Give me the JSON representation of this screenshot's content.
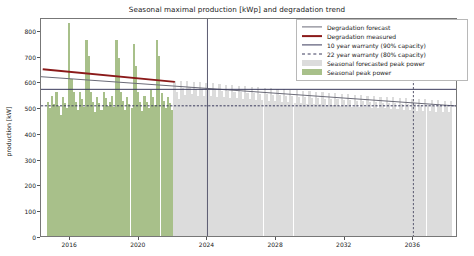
{
  "chart_data": {
    "type": "bar",
    "title": "Seasonal maximal production [kWp] and degradation trend",
    "xlabel": "",
    "ylabel": "production [kW]",
    "ylim": [
      0,
      850
    ],
    "xlim": [
      2014.3,
      2038.6
    ],
    "yticks": [
      0,
      100,
      200,
      300,
      400,
      500,
      600,
      700,
      800
    ],
    "xticks": [
      2016,
      2020,
      2024,
      2028,
      2032,
      2036
    ],
    "grid": false,
    "legend_position": "upper right",
    "colors": {
      "degradation_forecast": "#6b6b78",
      "degradation_measured": "#8b1a1a",
      "warranty_10yr": "#3a3a5c",
      "warranty_22yr": "#3a3a5c",
      "seasonal_forecast_bars": "#dcdcdc",
      "seasonal_peak_bars": "#a8c08a",
      "axis": "#777777",
      "text": "#1a1a1a"
    },
    "series": [
      {
        "name": "Degradation forecast",
        "type": "line",
        "style": "solid",
        "color": "#6b6b78",
        "points": [
          [
            2014.3,
            626
          ],
          [
            2038.6,
            512
          ]
        ]
      },
      {
        "name": "Degradation measured",
        "type": "line",
        "style": "solid",
        "color": "#8b1a1a",
        "points": [
          [
            2014.4,
            655
          ],
          [
            2022.1,
            606
          ]
        ]
      },
      {
        "name": "10 year warranty (90% capacity)",
        "type": "hline",
        "style": "solid",
        "color": "#3a3a5c",
        "value": 577
      },
      {
        "name": "22 year warranty (80% capacity)",
        "type": "hline",
        "style": "dashed",
        "color": "#3a3a5c",
        "value": 513
      },
      {
        "name": "10 year warranty end",
        "type": "vline",
        "style": "solid",
        "color": "#5a5a70",
        "value": 2024.0
      },
      {
        "name": "22 year warranty end",
        "type": "vline",
        "style": "dashed",
        "color": "#5a5a70",
        "value": 2036.0
      }
    ],
    "bar_series": [
      {
        "name": "Seasonal peak power",
        "color": "#a8c08a",
        "x": [
          2014.7,
          2014.82,
          2014.95,
          2015.08,
          2015.2,
          2015.33,
          2015.45,
          2015.58,
          2015.7,
          2015.83,
          2015.95,
          2016.08,
          2016.2,
          2016.33,
          2016.45,
          2016.58,
          2016.7,
          2016.83,
          2016.95,
          2017.08,
          2017.2,
          2017.33,
          2017.45,
          2017.58,
          2017.7,
          2017.83,
          2017.95,
          2018.08,
          2018.2,
          2018.33,
          2018.45,
          2018.58,
          2018.7,
          2018.83,
          2018.95,
          2019.08,
          2019.2,
          2019.33,
          2019.45,
          2019.58,
          2019.7,
          2019.83,
          2019.95,
          2020.08,
          2020.2,
          2020.33,
          2020.45,
          2020.58,
          2020.7,
          2020.83,
          2020.95,
          2021.08,
          2021.2,
          2021.33,
          2021.45,
          2021.58,
          2021.7,
          2021.83,
          2021.95
        ],
        "values": [
          520,
          498,
          545,
          512,
          560,
          505,
          470,
          540,
          515,
          495,
          825,
          610,
          560,
          520,
          490,
          560,
          530,
          500,
          760,
          700,
          560,
          520,
          480,
          540,
          515,
          490,
          560,
          535,
          505,
          520,
          545,
          500,
          760,
          690,
          560,
          525,
          490,
          540,
          512,
          495,
          745,
          660,
          560,
          520,
          485,
          545,
          520,
          498,
          565,
          540,
          510,
          760,
          700,
          555,
          525,
          495,
          540,
          515,
          490
        ]
      },
      {
        "name": "Seasonal forecasted peak power",
        "color": "#dcdcdc",
        "x": [
          2022.08,
          2022.2,
          2022.33,
          2022.45,
          2022.58,
          2022.7,
          2022.83,
          2022.95,
          2023.08,
          2023.2,
          2023.33,
          2023.45,
          2023.58,
          2023.7,
          2023.83,
          2023.95,
          2024.08,
          2024.2,
          2024.33,
          2024.45,
          2024.58,
          2024.7,
          2024.83,
          2024.95,
          2025.08,
          2025.2,
          2025.33,
          2025.45,
          2025.58,
          2025.7,
          2025.83,
          2025.95,
          2026.08,
          2026.2,
          2026.33,
          2026.45,
          2026.58,
          2026.7,
          2026.83,
          2026.95,
          2027.08,
          2027.2,
          2027.33,
          2027.45,
          2027.58,
          2027.7,
          2027.83,
          2027.95,
          2028.08,
          2028.2,
          2028.33,
          2028.45,
          2028.58,
          2028.7,
          2028.83,
          2028.95,
          2029.08,
          2029.2,
          2029.33,
          2029.45,
          2029.58,
          2029.7,
          2029.83,
          2029.95,
          2030.08,
          2030.2,
          2030.33,
          2030.45,
          2030.58,
          2030.7,
          2030.83,
          2030.95,
          2031.08,
          2031.2,
          2031.33,
          2031.45,
          2031.58,
          2031.7,
          2031.83,
          2031.95,
          2032.08,
          2032.2,
          2032.33,
          2032.45,
          2032.58,
          2032.7,
          2032.83,
          2032.95,
          2033.08,
          2033.2,
          2033.33,
          2033.45,
          2033.58,
          2033.7,
          2033.83,
          2033.95,
          2034.08,
          2034.2,
          2034.33,
          2034.45,
          2034.58,
          2034.7,
          2034.83,
          2034.95,
          2035.08,
          2035.2,
          2035.33,
          2035.45,
          2035.58,
          2035.7,
          2035.83,
          2035.95,
          2036.08,
          2036.2,
          2036.33,
          2036.45,
          2036.58,
          2036.7,
          2036.83,
          2036.95,
          2037.08,
          2037.2,
          2037.33,
          2037.45,
          2037.58,
          2037.7,
          2037.83,
          2037.95,
          2038.08,
          2038.2,
          2038.33,
          2038.45
        ],
        "values": [
          600,
          560,
          530,
          600,
          575,
          548,
          600,
          578,
          552,
          598,
          572,
          545,
          596,
          570,
          543,
          594,
          568,
          542,
          592,
          566,
          540,
          590,
          564,
          538,
          588,
          562,
          536,
          586,
          560,
          534,
          584,
          558,
          532,
          582,
          556,
          530,
          580,
          554,
          528,
          578,
          552,
          527,
          576,
          550,
          525,
          574,
          548,
          523,
          572,
          546,
          521,
          570,
          544,
          519,
          568,
          542,
          518,
          566,
          540,
          516,
          564,
          538,
          514,
          562,
          537,
          512,
          560,
          535,
          511,
          558,
          533,
          509,
          556,
          531,
          507,
          554,
          530,
          506,
          552,
          528,
          504,
          550,
          526,
          502,
          548,
          525,
          501,
          547,
          523,
          499,
          545,
          521,
          498,
          543,
          520,
          496,
          541,
          518,
          495,
          540,
          517,
          493,
          538,
          515,
          492,
          536,
          514,
          490,
          535,
          512,
          489,
          533,
          511,
          487,
          531,
          509,
          486,
          530,
          508,
          484,
          528,
          506,
          483,
          526,
          505,
          482,
          525,
          503,
          480,
          523
        ]
      }
    ]
  },
  "legend": {
    "items": [
      {
        "label": "Degradation forecast",
        "key": "line-solid",
        "color": "#6b6b78"
      },
      {
        "label": "Degradation measured",
        "key": "line-thick",
        "color": "#8b1a1a"
      },
      {
        "label": "10 year warranty (90% capacity)",
        "key": "line-solid",
        "color": "#3a3a5c"
      },
      {
        "label": "22 year warranty (80% capacity)",
        "key": "line-dashed",
        "color": "#3a3a5c"
      },
      {
        "label": "Seasonal forecasted peak power",
        "key": "patch",
        "color": "#dcdcdc"
      },
      {
        "label": "Seasonal peak power",
        "key": "patch",
        "color": "#a8c08a"
      }
    ]
  }
}
